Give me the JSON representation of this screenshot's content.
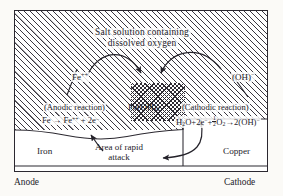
{
  "diagram": {
    "title_line1": "Salt solution containing",
    "title_line2": "dissolved oxygen",
    "electrolyte_region_name": "salt solution electrolyte",
    "ions": {
      "iron_ion": "Fe",
      "iron_ion_charge": "++",
      "hydroxide_ion": "(OH)",
      "hydroxide_ion_charge": "−"
    },
    "product": {
      "formula_main": "Fe(OH)",
      "formula_sub": "2"
    },
    "anodic": {
      "name": "(Anodic reaction)",
      "equation_plain": "Fe → Fe++ + 2e−",
      "eq_p1": "Fe → Fe",
      "eq_sup1": "++",
      "eq_p2": " + 2e",
      "eq_sup2": "−"
    },
    "cathodic": {
      "name": "(Cathodic reaction)",
      "equation_plain": "H2O+2e−+½O2→2(OH)−",
      "eq_p1": "H",
      "eq_sub1": "2",
      "eq_p2": "O+2e",
      "eq_sup1": "−",
      "eq_p3": "+",
      "frac_num": "1",
      "frac_den": "2",
      "eq_p4": "O",
      "eq_sub2": "2",
      "eq_p5": "→2(OH)",
      "eq_sup2": "−"
    },
    "metals": {
      "left_metal": "Iron",
      "right_metal": "Copper"
    },
    "attack_line1": "Area of rapid",
    "attack_line2": "attack",
    "electron_current": "Electron current",
    "terminals": {
      "left": "Anode",
      "right": "Cathode"
    },
    "colors": {
      "ink": "#24222a",
      "hatch": "#3a3740",
      "page_background": "#fbfaf7",
      "cell_background": "#ffffff"
    }
  }
}
